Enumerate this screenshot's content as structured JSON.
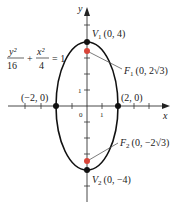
{
  "equation": {
    "num1": "y²",
    "den1": "16",
    "plus": "+",
    "num2": "x²",
    "den2": "4",
    "rhs": "= 1"
  },
  "axes": {
    "x_label": "x",
    "y_label": "y",
    "origin_label": "0",
    "x_tick_label": "1",
    "y_tick_label": "1"
  },
  "points": {
    "v1": {
      "name": "V",
      "sub": "1",
      "coords": "(0, 4)"
    },
    "v2": {
      "name": "V",
      "sub": "2",
      "coords": "(0, −4)"
    },
    "f1": {
      "name": "F",
      "sub": "1",
      "coords": "(0, 2√3)"
    },
    "f2": {
      "name": "F",
      "sub": "2",
      "coords": "(0, −2√3)"
    },
    "left": {
      "coords": "(−2, 0)"
    },
    "right": {
      "coords": "(2, 0)"
    }
  },
  "colors": {
    "curve": "#111111",
    "axis": "#333333",
    "focus": "#d9463a",
    "vertex": "#111111"
  }
}
